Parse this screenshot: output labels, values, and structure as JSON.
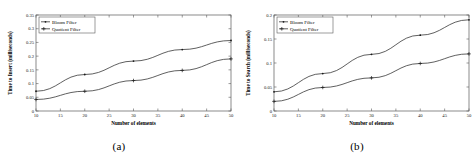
{
  "figure": {
    "panels": [
      {
        "caption": "(a)",
        "chart_data": {
          "type": "line",
          "title": "",
          "xlabel": "Number of elements",
          "ylabel": "Time to Insert (milliseconds)",
          "xlim": [
            10,
            50
          ],
          "ylim": [
            0,
            0.35
          ],
          "xticks": [
            10,
            15,
            20,
            25,
            30,
            35,
            40,
            45,
            50
          ],
          "yticks": [
            0,
            0.05,
            0.1,
            0.15,
            0.2,
            0.25,
            0.3,
            0.35
          ],
          "xticklabels": [
            "10",
            "15",
            "20",
            "25",
            "30",
            "35",
            "40",
            "45",
            "50"
          ],
          "yticklabels": [
            "0",
            "0.05",
            "0.1",
            "0.15",
            "0.2",
            "0.25",
            "0.3",
            "0.35"
          ],
          "grid": false,
          "legend_position": "upper left",
          "x": [
            10,
            20,
            30,
            40,
            50
          ],
          "series": [
            {
              "name": "Bloom Filter",
              "marker": "dot",
              "values": [
                0.072,
                0.133,
                0.182,
                0.224,
                0.257
              ]
            },
            {
              "name": "Quotient Filter",
              "marker": "plus",
              "values": [
                0.042,
                0.072,
                0.111,
                0.148,
                0.19
              ]
            }
          ]
        }
      },
      {
        "caption": "(b)",
        "chart_data": {
          "type": "line",
          "title": "",
          "xlabel": "Number of elements",
          "ylabel": "Time to Search (milliseconds)",
          "xlim": [
            10,
            50
          ],
          "ylim": [
            0,
            0.2
          ],
          "xticks": [
            10,
            15,
            20,
            25,
            30,
            35,
            40,
            45,
            50
          ],
          "yticks": [
            0,
            0.05,
            0.1,
            0.15,
            0.2
          ],
          "xticklabels": [
            "10",
            "15",
            "20",
            "25",
            "30",
            "35",
            "40",
            "45",
            "50"
          ],
          "yticklabels": [
            "0",
            "0.05",
            "0.1",
            "0.15",
            "0.2"
          ],
          "grid": false,
          "legend_position": "upper left",
          "x": [
            10,
            20,
            30,
            40,
            50
          ],
          "series": [
            {
              "name": "Bloom Filter",
              "marker": "dot",
              "values": [
                0.04,
                0.078,
                0.118,
                0.158,
                0.19
              ]
            },
            {
              "name": "Quotient Filter",
              "marker": "plus",
              "values": [
                0.02,
                0.049,
                0.069,
                0.099,
                0.119
              ]
            }
          ]
        }
      }
    ]
  }
}
